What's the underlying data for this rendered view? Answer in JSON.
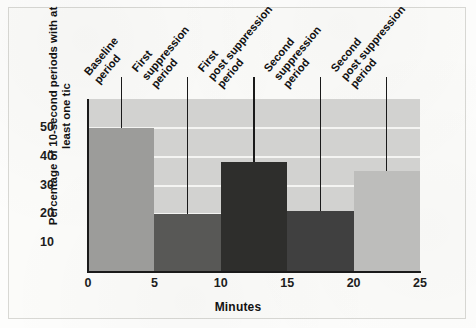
{
  "figure": {
    "background_color": "#fbfbf9",
    "plot_background_color": "#d2d2d0",
    "gridline_color": "#f4f4f2",
    "axis_color": "#1a1a1a"
  },
  "chart_data": {
    "type": "bar",
    "title": "",
    "subtitle": "",
    "xlabel": "Minutes",
    "ylabel": "Percentage of 10-second periods with at least one tic",
    "ylabel_line1": "Percentage of 10-second periods",
    "ylabel_line2": "with at least one tic",
    "xlim": [
      0,
      25
    ],
    "ylim": [
      0,
      60
    ],
    "xticks": [
      "0",
      "5",
      "10",
      "15",
      "20",
      "25"
    ],
    "xtick_values": [
      0,
      5,
      10,
      15,
      20,
      25
    ],
    "yticks": [
      "10",
      "20",
      "30",
      "40",
      "50"
    ],
    "ytick_values": [
      10,
      20,
      30,
      40,
      50
    ],
    "grid": "horizontal",
    "legend": "none",
    "bar_width_minutes": 5,
    "categories": [
      "0-5",
      "5-10",
      "10-15",
      "15-20",
      "20-25"
    ],
    "values": [
      50,
      20,
      38,
      21,
      35
    ],
    "bar_colors": [
      "#9c9c9a",
      "#585856",
      "#2e2e2c",
      "#404040",
      "#bdbdbb"
    ],
    "annotations": [
      {
        "text": "Baseline period",
        "lines": [
          "Baseline",
          "period"
        ],
        "x_minutes": 2.5,
        "leader_to_value": 50
      },
      {
        "text": "First suppression period",
        "lines": [
          "First",
          "suppression",
          "period"
        ],
        "x_minutes": 7.5,
        "leader_to_value": 20
      },
      {
        "text": "First post suppression period",
        "lines": [
          "First",
          "post suppression",
          "period"
        ],
        "x_minutes": 12.5,
        "leader_to_value": 38
      },
      {
        "text": "Second suppression period",
        "lines": [
          "Second",
          "suppression",
          "period"
        ],
        "x_minutes": 17.5,
        "leader_to_value": 21
      },
      {
        "text": "Second post suppression period",
        "lines": [
          "Second",
          "post suppression",
          "period"
        ],
        "x_minutes": 22.5,
        "leader_to_value": 35
      }
    ]
  }
}
